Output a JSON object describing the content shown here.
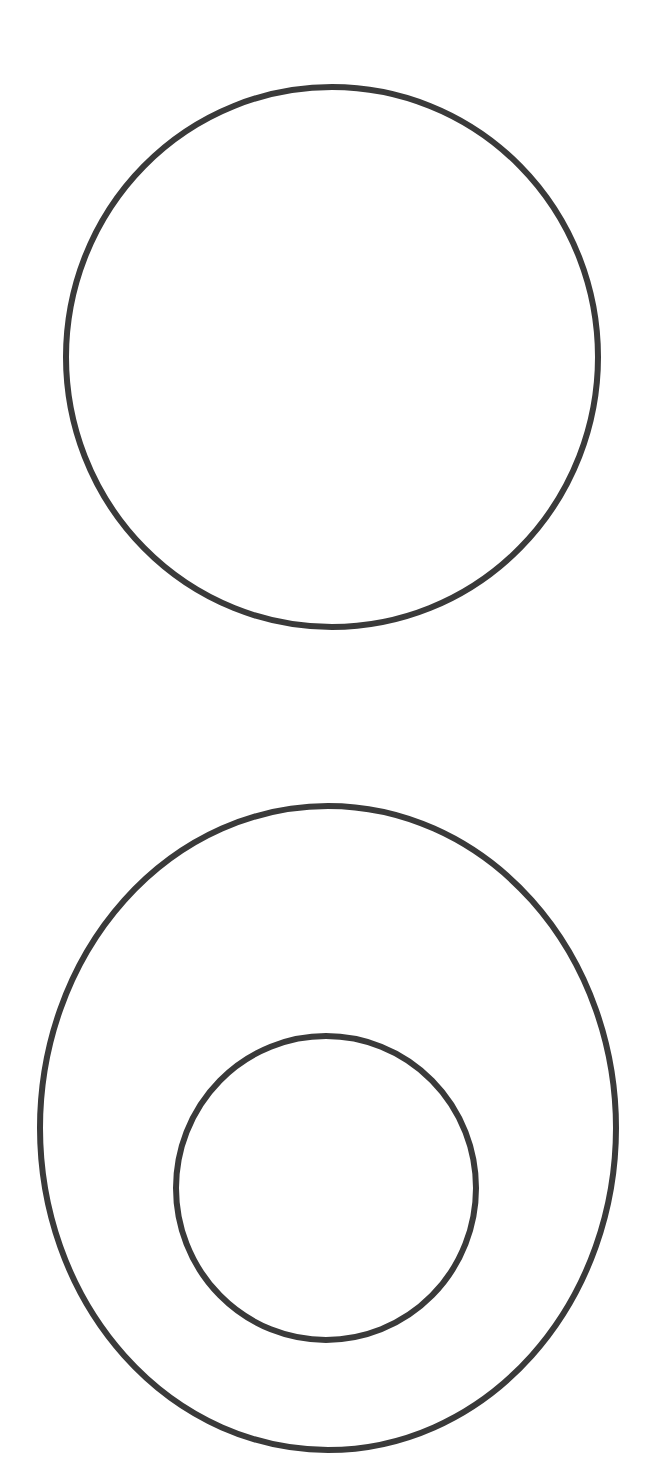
{
  "diagram": {
    "background": "#ffffff",
    "stroke_color": "#3a3a3a",
    "stroke_width": 6,
    "shapes": [
      {
        "name": "top-circle",
        "cx": 332,
        "cy": 357,
        "rx": 266,
        "ry": 270
      },
      {
        "name": "bottom-outer-circle",
        "cx": 328,
        "cy": 1128,
        "rx": 288,
        "ry": 322
      },
      {
        "name": "bottom-inner-circle",
        "cx": 326,
        "cy": 1188,
        "rx": 150,
        "ry": 152
      }
    ]
  }
}
